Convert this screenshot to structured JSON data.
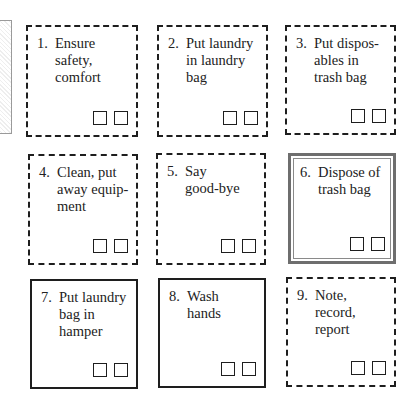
{
  "diagram": {
    "type": "procedure-checklist",
    "steps": [
      {
        "number": "1.",
        "label": "Ensure\nsafety,\ncomfort",
        "border": "dashed"
      },
      {
        "number": "2.",
        "label": "Put laundry\nin laundry\nbag",
        "border": "dashed"
      },
      {
        "number": "3.",
        "label": "Put dispos-\nables in\ntrash bag",
        "border": "dashed"
      },
      {
        "number": "4.",
        "label": "Clean, put\naway equip-\nment",
        "border": "dashed"
      },
      {
        "number": "5.",
        "label": "Say\ngood-bye",
        "border": "dashed"
      },
      {
        "number": "6.",
        "label": "Dispose of\ntrash bag",
        "border": "double"
      },
      {
        "number": "7.",
        "label": "Put laundry\nbag in\nhamper",
        "border": "solid"
      },
      {
        "number": "8.",
        "label": "Wash\nhands",
        "border": "solid"
      },
      {
        "number": "9.",
        "label": "Note,\nrecord,\nreport",
        "border": "dashed"
      }
    ],
    "checkboxes_per_step": 2,
    "colors": {
      "line": "#1e1e1e",
      "double_border": "#6e6e6e",
      "background": "#ffffff"
    }
  }
}
